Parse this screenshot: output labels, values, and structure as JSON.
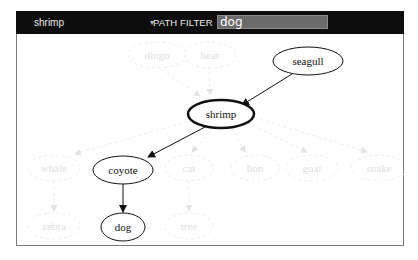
{
  "toolbar": {
    "selected_node": "shrimp",
    "filter_label": "PATH FILTER",
    "filter_value": "dog"
  },
  "graph": {
    "highlighted_nodes": [
      {
        "id": "seagull",
        "label": "seagull"
      },
      {
        "id": "shrimp",
        "label": "shrimp",
        "selected": true
      },
      {
        "id": "coyote",
        "label": "coyote"
      },
      {
        "id": "dog",
        "label": "dog"
      }
    ],
    "faded_nodes": [
      {
        "id": "dingo",
        "label": "dingo"
      },
      {
        "id": "bear",
        "label": "bear"
      },
      {
        "id": "whale",
        "label": "whale"
      },
      {
        "id": "cat",
        "label": "cat"
      },
      {
        "id": "lion",
        "label": "lion"
      },
      {
        "id": "goat",
        "label": "goat"
      },
      {
        "id": "snake",
        "label": "snake"
      },
      {
        "id": "zebra",
        "label": "zebra"
      },
      {
        "id": "tree",
        "label": "tree"
      }
    ],
    "edges_highlighted": [
      {
        "from": "seagull",
        "to": "shrimp"
      },
      {
        "from": "shrimp",
        "to": "coyote"
      },
      {
        "from": "coyote",
        "to": "dog"
      }
    ]
  }
}
